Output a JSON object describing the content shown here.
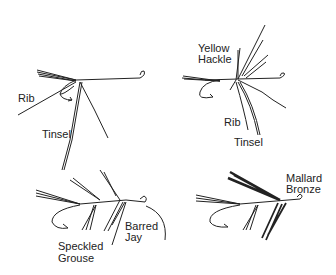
{
  "panels": [
    {
      "id": "step1",
      "labels": [
        "Rib",
        "Tinsel"
      ]
    },
    {
      "id": "step2",
      "labels": [
        "Yellow",
        "Hackle",
        "Rib",
        "Tinsel"
      ]
    },
    {
      "id": "step3",
      "labels": [
        "Barred",
        "Jay",
        "Speckled",
        "Grouse"
      ]
    },
    {
      "id": "step4",
      "labels": [
        "Mallard",
        "Bronze"
      ]
    }
  ],
  "colors": {
    "ink": "#222222",
    "background": "#ffffff"
  }
}
